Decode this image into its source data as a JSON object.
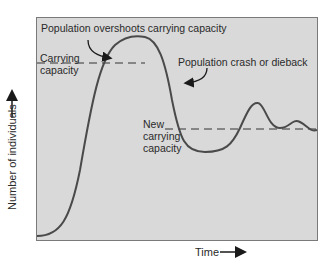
{
  "diagram": {
    "type": "population-growth-curve",
    "axes": {
      "y_label": "Number of individuals",
      "x_label": "Time"
    },
    "annotations": {
      "overshoot": "Population overshoots carrying capacity",
      "carrying_capacity_line1": "Carrying",
      "carrying_capacity_line2": "capacity",
      "crash": "Population crash or dieback",
      "new_cc_line1": "New",
      "new_cc_line2": "carrying",
      "new_cc_line3": "capacity"
    },
    "colors": {
      "plot_background": "#d9d9d9",
      "curve": "#4a4a4a",
      "frame": "#7a7a7a"
    }
  }
}
